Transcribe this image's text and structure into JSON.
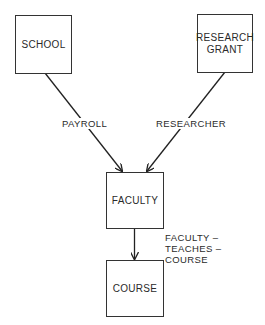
{
  "diagram": {
    "type": "entity-relationship (Bachman) diagram",
    "entities": [
      {
        "id": "school",
        "label": "SCHOOL"
      },
      {
        "id": "research_grant",
        "label": "RESEARCH\nGRANT"
      },
      {
        "id": "faculty",
        "label": "FACULTY"
      },
      {
        "id": "course",
        "label": "COURSE"
      }
    ],
    "relationships": [
      {
        "from": "school",
        "to": "faculty",
        "label": "PAYROLL"
      },
      {
        "from": "research_grant",
        "to": "faculty",
        "label": "RESEARCHER"
      },
      {
        "from": "faculty",
        "to": "course",
        "label": "FACULTY –\nTEACHES –\nCOURSE"
      }
    ]
  }
}
